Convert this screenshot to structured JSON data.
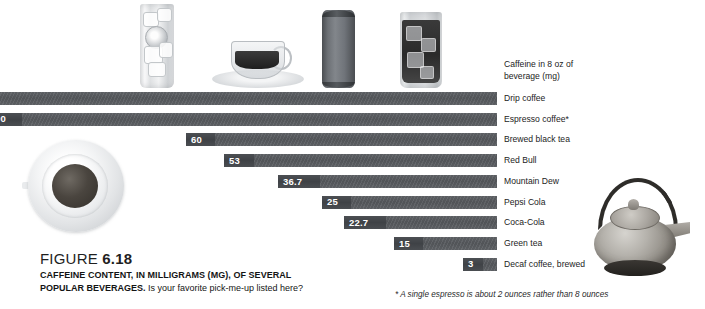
{
  "chart_data": {
    "type": "bar",
    "orientation": "horizontal",
    "title": "CAFFEINE CONTENT, IN MILLIGRAMS (MG), OF SEVERAL POPULAR BEVERAGES.",
    "axis_title": "Caffeine in 8 oz of beverage (mg)",
    "xlabel": "Caffeine in 8 oz of beverage (mg)",
    "ylabel": "",
    "grid": false,
    "legend": "none",
    "xlim": [
      0,
      200
    ],
    "categories": [
      "Drip coffee",
      "Espresso coffee*",
      "Brewed black tea",
      "Red Bull",
      "Mountain Dew",
      "Pepsi Cola",
      "Coca-Cola",
      "Green tea",
      "Decaf coffee, brewed"
    ],
    "values": [
      null,
      100,
      60,
      53,
      36.7,
      25,
      22.7,
      15,
      3
    ],
    "value_labels": [
      "",
      "00",
      "60",
      "53",
      "36.7",
      "25",
      "22.7",
      "15",
      "3"
    ],
    "note": "Bars are right-aligned; the longest bars extend past the left edge of the image so the Drip coffee value and the leading digit of the Espresso value are cropped."
  },
  "bars": [
    {
      "label": "Drip coffee",
      "value_label": "",
      "bar_left": -22,
      "bar_width": 519,
      "seg_width": 0
    },
    {
      "label": "Espresso coffee*",
      "value_label": "00",
      "bar_left": -10,
      "bar_width": 507,
      "seg_width": 32
    },
    {
      "label": "Brewed black tea",
      "value_label": "60",
      "bar_left": 186,
      "bar_width": 311,
      "seg_width": 29
    },
    {
      "label": "Red Bull",
      "value_label": "53",
      "bar_left": 224,
      "bar_width": 273,
      "seg_width": 30
    },
    {
      "label": "Mountain Dew",
      "value_label": "36.7",
      "bar_left": 278,
      "bar_width": 219,
      "seg_width": 42
    },
    {
      "label": "Pepsi Cola",
      "value_label": "25",
      "bar_left": 322,
      "bar_width": 175,
      "seg_width": 29
    },
    {
      "label": "Coca-Cola",
      "value_label": "22.7",
      "bar_left": 344,
      "bar_width": 153,
      "seg_width": 42
    },
    {
      "label": "Green tea",
      "value_label": "15",
      "bar_left": 394,
      "bar_width": 103,
      "seg_width": 29
    },
    {
      "label": "Decaf coffee, brewed",
      "value_label": "3",
      "bar_left": 463,
      "bar_width": 34,
      "seg_width": 20
    }
  ],
  "axis": {
    "title_line1": "Caffeine in 8 oz of",
    "title_line2": "beverage (mg)"
  },
  "caption": {
    "figure_word": "FIGURE",
    "figure_number": "6.18",
    "title_line1": "CAFFEINE CONTENT, IN MILLIGRAMS (MG), OF SEVERAL",
    "title_line2_bold": "POPULAR BEVERAGES.",
    "title_line2_rest": " Is your favorite pick-me-up listed here?"
  },
  "footnote": {
    "text": "* A single espresso is about 2 ounces rather than 8 ounces"
  },
  "photos": [
    {
      "name": "iced-lemon-drink-photo"
    },
    {
      "name": "espresso-cup-photo"
    },
    {
      "name": "energy-drink-can-photo"
    },
    {
      "name": "iced-cola-glass-photo"
    },
    {
      "name": "overhead-coffee-cup-photo"
    },
    {
      "name": "cast-iron-teapot-photo"
    }
  ],
  "colors": {
    "bar": "#5a5d61",
    "bar_value_segment": "#43464a",
    "value_text": "#ffffff",
    "label_text": "#1c1c1c",
    "background": "#ffffff"
  }
}
